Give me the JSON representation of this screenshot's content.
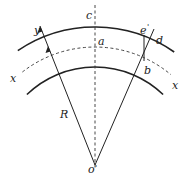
{
  "figure": {
    "labels": {
      "c": "c",
      "a": "a",
      "e": "e",
      "e_prime_mark": "'",
      "d": "d",
      "b": "b",
      "y": "y",
      "x_left": "x",
      "x_right": "x",
      "R": "R",
      "o": "o",
      "o_prime_mark": "'"
    },
    "colors": {
      "stroke": "#222222",
      "background": "#ffffff"
    }
  }
}
